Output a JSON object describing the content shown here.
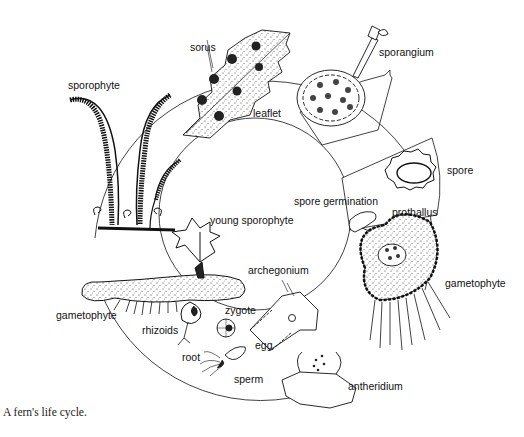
{
  "figure": {
    "caption": "A fern's life cycle.",
    "ink_color": "#111111",
    "background": "#ffffff",
    "labels": {
      "sorus": "sorus",
      "sporangium": "sporangium",
      "sporophyte": "sporophyte",
      "leaflet": "leaflet",
      "spore": "spore",
      "spore_germination": "spore germination",
      "prothallus": "prothallus",
      "young_sporophyte": "young sporophyte",
      "archegonium": "archegonium",
      "gametophyte_right": "gametophyte",
      "gametophyte_left": "gametophyte",
      "rhizoids": "rhizoids",
      "zygote": "zygote",
      "egg": "egg",
      "root": "root",
      "sperm": "sperm",
      "antheridium": "antheridium"
    },
    "stages": [
      "sporophyte",
      "leaflet",
      "sorus",
      "sporangium",
      "spore",
      "spore germination",
      "prothallus",
      "gametophyte",
      "archegonium",
      "antheridium",
      "egg",
      "sperm",
      "zygote",
      "young sporophyte"
    ]
  }
}
